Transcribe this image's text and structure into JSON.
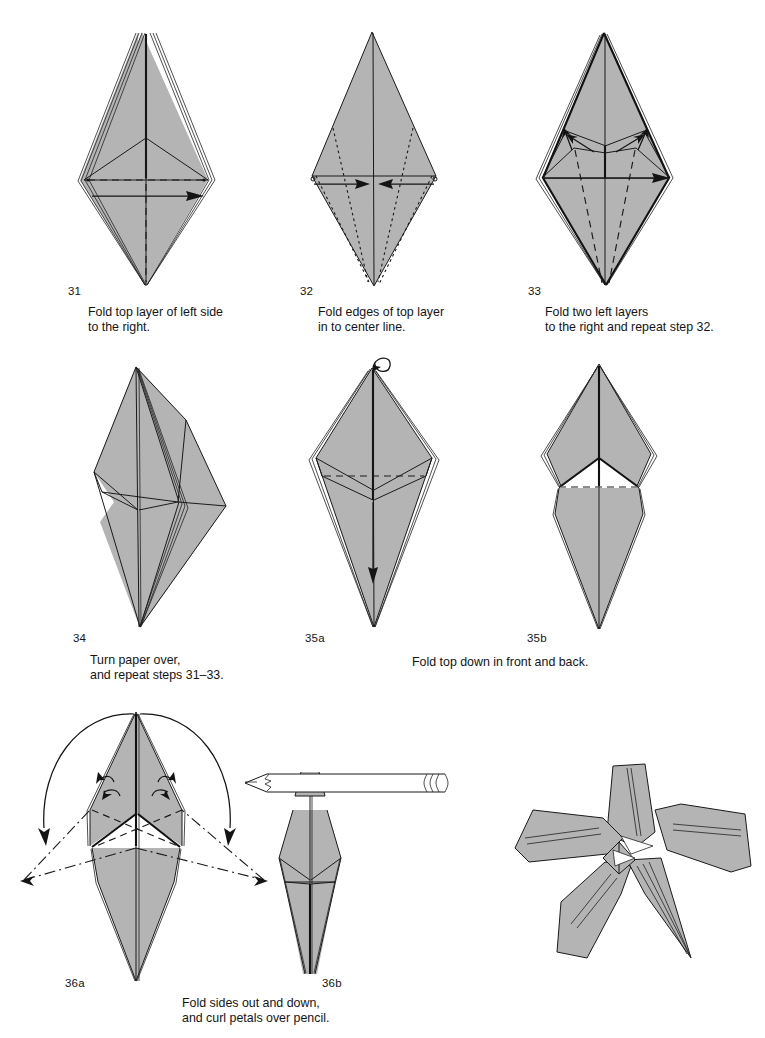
{
  "page": {
    "background_color": "#ffffff",
    "paper_fill_color": "#b4b4b4",
    "line_color": "#1a1a1a"
  },
  "steps": [
    {
      "number": "31",
      "caption": "Fold top layer of left side\nto the right.",
      "figure_name": "diagram-step-31",
      "description": "Tall layered kite, dashed vertical center line, horizontal fold line and arrow pointing right"
    },
    {
      "number": "32",
      "caption": "Fold edges of top layer\nin to center line.",
      "figure_name": "diagram-step-32",
      "description": "Plain diamond with dotted diagonal fold lines and two arrows pointing in to the center"
    },
    {
      "number": "33",
      "caption": "Fold two left layers\nto the right and repeat step 32.",
      "figure_name": "diagram-step-33",
      "description": "Layered diamond with inner flaps, dashed lines and arrows pointing right and up"
    },
    {
      "number": "34",
      "caption": "Turn paper over,\nand repeat steps 31–33.",
      "figure_name": "diagram-step-34",
      "description": "Asymmetric layered form with flaps swung to the right"
    },
    {
      "number": "35a",
      "caption": "",
      "figure_name": "diagram-step-35a",
      "description": "Narrow layered kite with dashed horizontal fold line, loop arrow at top and down arrow inside"
    },
    {
      "number": "35b",
      "caption": "",
      "figure_name": "diagram-step-35b",
      "description": "Form with the top folded down, dashed horizontal line across the middle"
    },
    {
      "number": "36a",
      "caption": "",
      "figure_name": "diagram-step-36a",
      "description": "Form with two large curved arrows sweeping the petals out and down, dash-dot target outlines"
    },
    {
      "number": "36b",
      "caption": "",
      "figure_name": "diagram-step-36b",
      "description": "Petal curled over a horizontal pencil"
    }
  ],
  "shared_captions": [
    {
      "name": "caption-fold-top-down",
      "text": "Fold top down in front and back."
    },
    {
      "name": "caption-fold-sides-out",
      "text": "Fold sides out and down,\nand curl petals  over pencil."
    }
  ],
  "final_model": {
    "name": "finished-lily-illustration",
    "label": "Finished origami lily with curled petals"
  },
  "tools": {
    "pencil": {
      "name": "pencil-illustration",
      "label": "Pencil"
    }
  }
}
